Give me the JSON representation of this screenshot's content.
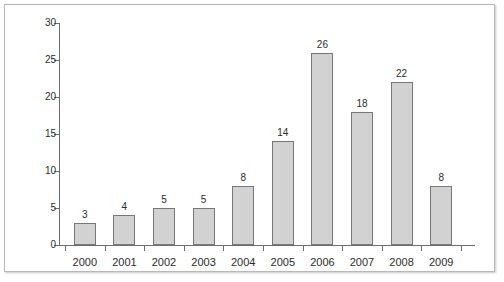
{
  "chart_data": {
    "type": "bar",
    "title": "",
    "subtitle": "",
    "xlabel": "",
    "ylabel": "",
    "categories": [
      "2000",
      "2001",
      "2002",
      "2003",
      "2004",
      "2005",
      "2006",
      "2007",
      "2008",
      "2009"
    ],
    "values": [
      3,
      4,
      5,
      5,
      8,
      14,
      26,
      18,
      22,
      8
    ],
    "value_labels": [
      "3",
      "4",
      "5",
      "5",
      "8",
      "14",
      "26",
      "18",
      "22",
      "8"
    ],
    "ylim": [
      0,
      30
    ],
    "yticks": [
      0,
      5,
      10,
      15,
      20,
      25,
      30
    ],
    "ytick_labels": [
      "0",
      "5",
      "10",
      "15",
      "20",
      "25",
      "30"
    ],
    "grid": false,
    "legend": null,
    "legend_position": "none",
    "bar_fill_color": "#d2d2d2",
    "bar_border_color": "#777777",
    "axis_color": "#6e6e6e",
    "text_color": "#2b2b2b",
    "frame_color": "#b8b8b8",
    "background_color": "#ffffff"
  }
}
